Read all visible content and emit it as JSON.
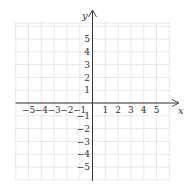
{
  "chart_data": {
    "type": "coordinate-grid",
    "title": "",
    "xlabel": "x",
    "ylabel": "y",
    "x_range": [
      -6,
      6
    ],
    "y_range": [
      -6,
      6
    ],
    "grid": true,
    "x_tick_labels": [
      "-5",
      "-4",
      "-3",
      "-2",
      "-1",
      "1",
      "2",
      "3",
      "4",
      "5"
    ],
    "y_tick_labels": [
      "5",
      "4",
      "3",
      "2",
      "1",
      "-1",
      "-2",
      "-3",
      "-4",
      "-5"
    ],
    "series": []
  },
  "axes": {
    "x_name": "x",
    "y_name": "y"
  },
  "colors": {
    "grid": "#cfcfcf",
    "axis": "#333333",
    "background": "#ffffff"
  }
}
